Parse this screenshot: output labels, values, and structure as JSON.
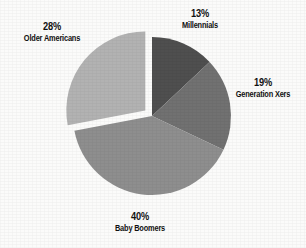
{
  "chart_data": {
    "type": "pie",
    "title": "",
    "subtitle": "",
    "xlabel": "",
    "ylabel": "",
    "legend_position": "none",
    "grid": false,
    "start_angle_deg": 0,
    "direction": "clockwise",
    "units": "percent",
    "total": 100,
    "categories": [
      "Millennials",
      "Generation Xers",
      "Baby Boomers",
      "Older Americans"
    ],
    "values": [
      13,
      19,
      40,
      28
    ],
    "slices": [
      {
        "name": "Millennials",
        "value": 13,
        "percent_label": "13%",
        "color": "#4f4f4f",
        "exploded": false,
        "start_deg": 0,
        "end_deg": 46.8
      },
      {
        "name": "Generation Xers",
        "value": 19,
        "percent_label": "19%",
        "color": "#717171",
        "exploded": false,
        "start_deg": 46.8,
        "end_deg": 115.2
      },
      {
        "name": "Baby Boomers",
        "value": 40,
        "percent_label": "40%",
        "color": "#8e8e8e",
        "exploded": false,
        "start_deg": 115.2,
        "end_deg": 259.2
      },
      {
        "name": "Older Americans",
        "value": 28,
        "percent_label": "28%",
        "color": "#b2b2b2",
        "exploded": true,
        "start_deg": 259.2,
        "end_deg": 360
      }
    ],
    "annotations": [
      {
        "text": "13%",
        "subtext": "Millennials",
        "position": "top"
      },
      {
        "text": "19%",
        "subtext": "Generation Xers",
        "position": "right"
      },
      {
        "text": "40%",
        "subtext": "Baby Boomers",
        "position": "bottom"
      },
      {
        "text": "28%",
        "subtext": "Older Americans",
        "position": "upper-left"
      }
    ]
  },
  "labels": {
    "millennials": {
      "pct": "13%",
      "name": "Millennials"
    },
    "genx": {
      "pct": "19%",
      "name": "Generation Xers"
    },
    "boomers": {
      "pct": "40%",
      "name": "Baby Boomers"
    },
    "older": {
      "pct": "28%",
      "name": "Older Americans"
    }
  },
  "colors": {
    "background": "#fbfbfa",
    "text": "#111111",
    "slice_millennials": "#4f4f4f",
    "slice_genx": "#717171",
    "slice_boomers": "#8e8e8e",
    "slice_older": "#b2b2b2"
  }
}
